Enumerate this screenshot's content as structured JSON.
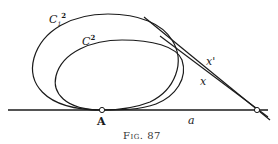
{
  "figure": {
    "caption": "Fig. 87",
    "labels": {
      "outer_curve": "C",
      "outer_curve_sub": "1",
      "outer_curve_sup": "2",
      "inner_curve": "C",
      "inner_curve_sup": "2",
      "tangent_outer": "x'",
      "tangent_inner": "x",
      "point": "A",
      "baseline": "a"
    },
    "colors": {
      "stroke": "#1a1a1a",
      "background": "#ffffff"
    }
  }
}
